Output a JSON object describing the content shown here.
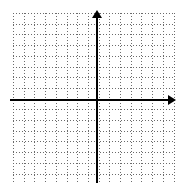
{
  "figure": {
    "title": "",
    "background_color": "#ffffff",
    "axis_color": "#000000",
    "grid_color": "#6b6b6b"
  },
  "chart_data": {
    "type": "scatter",
    "title": "",
    "subtitle": "",
    "xlabel": "",
    "ylabel": "",
    "xlim": [
      -8,
      7
    ],
    "ylim": [
      -7.5,
      8
    ],
    "x": [],
    "y": [],
    "series": [],
    "xticks": [],
    "yticks": [],
    "xtick_labels": [],
    "ytick_labels": [],
    "grid": true,
    "grid_style": "dotted",
    "grid_spacing": 1,
    "legend": false,
    "legend_position": "none",
    "annotations": [],
    "axis_arrows": {
      "x_positive": true,
      "x_negative": false,
      "y_positive": true,
      "y_negative": false
    },
    "origin": {
      "x": 0,
      "y": 0,
      "pixel_x": 97,
      "pixel_y": 100
    }
  },
  "grid": {
    "cell_size_px": 10.7,
    "columns": 16,
    "rows": 16,
    "left_px": 13,
    "top_px": 13,
    "width_px": 161,
    "height_px": 169
  },
  "axes": {
    "x_axis_label": "",
    "y_axis_label": "",
    "x_arrow_name": "x-axis-arrow",
    "y_arrow_name": "y-axis-arrow"
  }
}
